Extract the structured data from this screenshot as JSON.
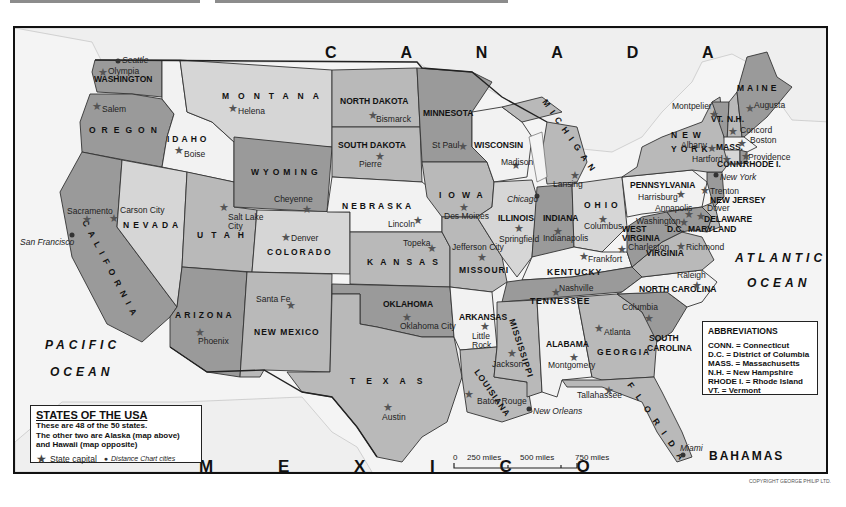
{
  "map": {
    "title": "STATES OF THE USA",
    "description_lines": [
      "These are 48 of the 50 states.",
      "The other two are Alaska (map above)",
      "and Hawaii (map opposite)"
    ],
    "legend": {
      "capital_symbol": "★",
      "capital_label": "State capital",
      "city_symbol": "●",
      "city_label": "Distance Chart cities"
    },
    "countries": {
      "north": "C A N A D A",
      "south": "M E X I C O",
      "bahamas": "BAHAMAS"
    },
    "oceans": {
      "pacific_1": "PACIFIC",
      "pacific_2": "OCEAN",
      "atlantic_1": "ATLANTIC",
      "atlantic_2": "OCEAN"
    },
    "abbreviations": {
      "title": "ABBREVIATIONS",
      "items": [
        "CONN. = Connecticut",
        "D.C. = District of Columbia",
        "MASS. = Massachusetts",
        "N.H. = New Hampshire",
        "RHODE I. = Rhode Island",
        "VT. = Vermont"
      ]
    },
    "scale": {
      "labels": [
        "0",
        "250 miles",
        "500 miles",
        "750 miles"
      ]
    },
    "copyright": "COPYRIGHT GEORGE PHILIP LTD.",
    "colors": {
      "dark": "#9a9a9a",
      "medium": "#b9b9b9",
      "light": "#d6d6d6",
      "white": "#f2f2f2",
      "water": "#f4f4f4"
    },
    "states": [
      {
        "name": "WASHINGTON",
        "capital": "Olympia"
      },
      {
        "name": "OREGON",
        "capital": "Salem"
      },
      {
        "name": "CALIFORNIA",
        "capital": "Sacramento"
      },
      {
        "name": "IDAHO",
        "capital": "Boise"
      },
      {
        "name": "NEVADA",
        "capital": "Carson City"
      },
      {
        "name": "MONTANA",
        "capital": "Helena"
      },
      {
        "name": "WYOMING",
        "capital": "Cheyenne"
      },
      {
        "name": "UTAH",
        "capital": "Salt Lake City"
      },
      {
        "name": "COLORADO",
        "capital": "Denver"
      },
      {
        "name": "ARIZONA",
        "capital": "Phoenix"
      },
      {
        "name": "NEW MEXICO",
        "capital": "Santa Fe"
      },
      {
        "name": "NORTH DAKOTA",
        "capital": "Bismarck"
      },
      {
        "name": "SOUTH DAKOTA",
        "capital": "Pierre"
      },
      {
        "name": "NEBRASKA",
        "capital": "Lincoln"
      },
      {
        "name": "KANSAS",
        "capital": "Topeka"
      },
      {
        "name": "OKLAHOMA",
        "capital": "Oklahoma City"
      },
      {
        "name": "TEXAS",
        "capital": "Austin"
      },
      {
        "name": "MINNESOTA",
        "capital": "St Paul"
      },
      {
        "name": "IOWA",
        "capital": "Des Moines"
      },
      {
        "name": "MISSOURI",
        "capital": "Jefferson City"
      },
      {
        "name": "ARKANSAS",
        "capital": "Little Rock"
      },
      {
        "name": "LOUISIANA",
        "capital": "Baton Rouge"
      },
      {
        "name": "WISCONSIN",
        "capital": "Madison"
      },
      {
        "name": "ILLINOIS",
        "capital": "Springfield"
      },
      {
        "name": "MICHIGAN",
        "capital": "Lansing"
      },
      {
        "name": "INDIANA",
        "capital": "Indianapolis"
      },
      {
        "name": "OHIO",
        "capital": "Columbus"
      },
      {
        "name": "KENTUCKY",
        "capital": "Frankfort"
      },
      {
        "name": "TENNESSEE",
        "capital": "Nashville"
      },
      {
        "name": "MISSISSIPPI",
        "capital": "Jackson"
      },
      {
        "name": "ALABAMA",
        "capital": "Montgomery"
      },
      {
        "name": "GEORGIA",
        "capital": "Atlanta"
      },
      {
        "name": "FLORIDA",
        "capital": "Tallahassee"
      },
      {
        "name": "SOUTH CAROLINA",
        "capital": "Columbia"
      },
      {
        "name": "NORTH CAROLINA",
        "capital": "Raleigh"
      },
      {
        "name": "VIRGINIA",
        "capital": "Richmond"
      },
      {
        "name": "WEST VIRGINIA",
        "capital": "Charleston"
      },
      {
        "name": "PENNSYLVANIA",
        "capital": "Harrisburg"
      },
      {
        "name": "NEW YORK",
        "capital": "Albany"
      },
      {
        "name": "NEW JERSEY",
        "capital": "Trenton"
      },
      {
        "name": "DELAWARE",
        "capital": "Dover"
      },
      {
        "name": "MARYLAND",
        "capital": "Annapolis"
      },
      {
        "name": "D.C.",
        "capital": "Washington"
      },
      {
        "name": "VT.",
        "capital": "Montpelier"
      },
      {
        "name": "N.H.",
        "capital": "Concord"
      },
      {
        "name": "MAINE",
        "capital": "Augusta"
      },
      {
        "name": "MASS.",
        "capital": "Boston"
      },
      {
        "name": "CONN.",
        "capital": "Hartford"
      },
      {
        "name": "RHODE I.",
        "capital": "Providence"
      }
    ],
    "distance_cities": [
      "Seattle",
      "San Francisco",
      "Chicago",
      "New York",
      "New Orleans",
      "Miami"
    ]
  }
}
